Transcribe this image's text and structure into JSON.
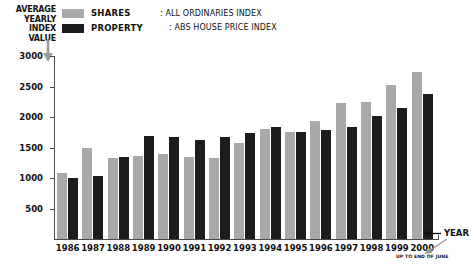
{
  "axis_title_lines": [
    "AVERAGE",
    "YEARLY",
    "INDEX",
    "VALUE"
  ],
  "legend": {
    "shares_label": "SHARES",
    "property_label": "PROPERTY",
    "shares_color": "#a9a9a9",
    "property_color": "#1c1c1c"
  },
  "notes": [
    ": ALL ORDINARIES INDEX",
    ": ABS HOUSE PRICE INDEX"
  ],
  "year_callout": "YEAR",
  "footnote": "UP TO END OF JUNE",
  "chart_data": {
    "type": "bar",
    "title": "",
    "xlabel": "YEAR",
    "ylabel": "AVERAGE YEARLY INDEX VALUE",
    "ylim": [
      0,
      3000
    ],
    "yticks": [
      500,
      1000,
      1500,
      2000,
      2500,
      3000
    ],
    "grid": false,
    "legend_position": "top-left",
    "categories": [
      "1986",
      "1987",
      "1988",
      "1989",
      "1990",
      "1991",
      "1992",
      "1993",
      "1994",
      "1995",
      "1996",
      "1997",
      "1998",
      "1999",
      "2000"
    ],
    "series": [
      {
        "name": "SHARES",
        "description": "ALL ORDINARIES INDEX",
        "color": "#a9a9a9",
        "values": [
          1090,
          1500,
          1320,
          1360,
          1390,
          1350,
          1320,
          1570,
          1800,
          1750,
          1940,
          2230,
          2240,
          2520,
          2730
        ]
      },
      {
        "name": "PROPERTY",
        "description": "ABS HOUSE PRICE INDEX",
        "color": "#1c1c1c",
        "values": [
          1000,
          1040,
          1340,
          1690,
          1680,
          1630,
          1670,
          1740,
          1830,
          1760,
          1790,
          1840,
          2020,
          2140,
          2380
        ]
      }
    ],
    "notes": [
      "2000 value is up to end of June"
    ]
  }
}
